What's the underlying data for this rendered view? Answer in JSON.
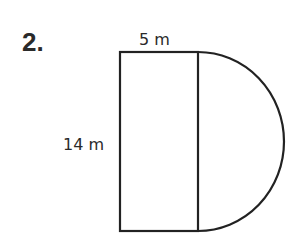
{
  "problem": {
    "number": "2."
  },
  "figure": {
    "shape": "rectangle with semicircle attached on right side",
    "labels": {
      "width": "5 m",
      "height": "14 m"
    },
    "stroke_color": "#222222",
    "rect": {
      "x": 120,
      "y": 52,
      "w": 78,
      "h": 179
    },
    "semicircle": {
      "cx": 198,
      "cy": 141.5,
      "rx": 86,
      "ry": 89.5
    }
  }
}
